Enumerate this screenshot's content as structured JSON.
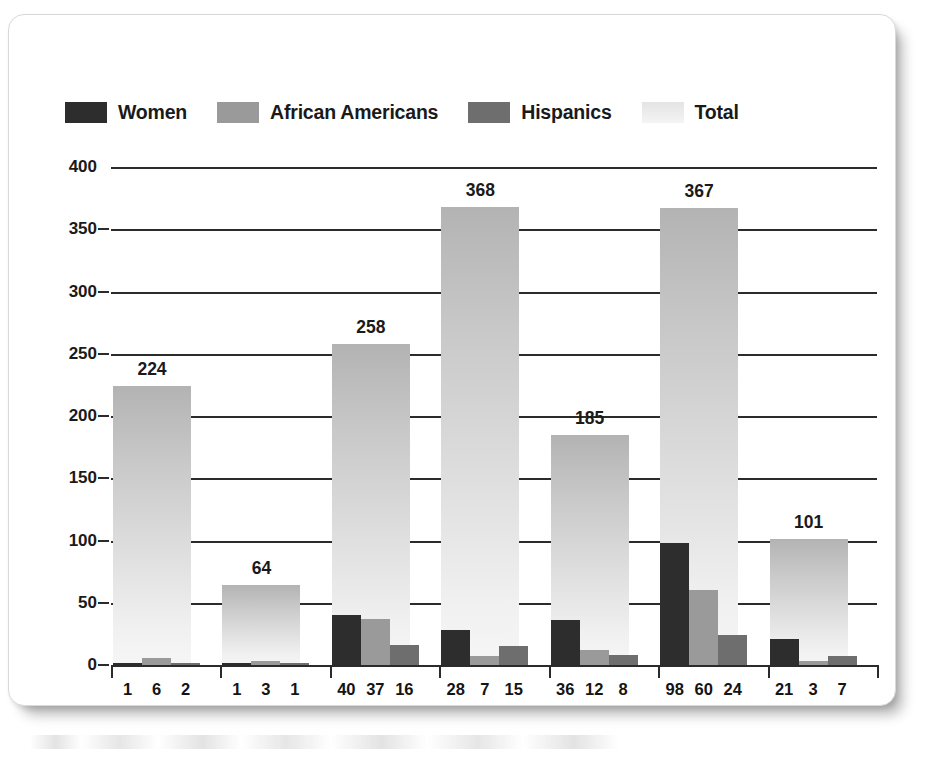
{
  "legend": {
    "items": [
      {
        "label": "Women",
        "key": "women",
        "color": "#2d2d2d"
      },
      {
        "label": "African Americans",
        "key": "african",
        "color": "#9a9a9a"
      },
      {
        "label": "Hispanics",
        "key": "hisp",
        "color": "#6e6e6e"
      },
      {
        "label": "Total",
        "key": "total",
        "color": "#ececec"
      }
    ]
  },
  "axis": {
    "y_ticks": [
      "400",
      "350",
      "300",
      "250",
      "200",
      "150",
      "100",
      "50",
      "0"
    ]
  },
  "chart_data": {
    "type": "bar",
    "title": "",
    "subtitle": "",
    "xlabel": "",
    "ylabel": "",
    "ylim": [
      0,
      400
    ],
    "ytick_values": [
      0,
      50,
      100,
      150,
      200,
      250,
      300,
      350,
      400
    ],
    "grid": true,
    "legend_position": "top-left",
    "categories": [
      "Nixon",
      "Ford",
      "Carter",
      "Reagan",
      "Bush",
      "Clinton",
      "George W. Bush"
    ],
    "series": [
      {
        "name": "Women",
        "values": [
          1,
          1,
          40,
          28,
          36,
          98,
          21
        ]
      },
      {
        "name": "African Americans",
        "values": [
          6,
          3,
          37,
          7,
          12,
          60,
          3
        ]
      },
      {
        "name": "Hispanics",
        "values": [
          2,
          1,
          16,
          15,
          8,
          24,
          7
        ]
      },
      {
        "name": "Total",
        "values": [
          224,
          64,
          258,
          368,
          185,
          367,
          101
        ]
      }
    ],
    "total_labels": [
      "224",
      "64",
      "258",
      "368",
      "367",
      "185",
      "101"
    ],
    "annotations": [
      {
        "category": "Nixon",
        "text": "224"
      },
      {
        "category": "Ford",
        "text": "64"
      },
      {
        "category": "Carter",
        "text": "258"
      },
      {
        "category": "Reagan",
        "text": "368"
      },
      {
        "category": "Bush",
        "text": "185"
      },
      {
        "category": "Clinton",
        "text": "367"
      },
      {
        "category": "George W. Bush",
        "text": "101"
      }
    ],
    "value_labels": [
      [
        "1",
        "6",
        "2"
      ],
      [
        "1",
        "3",
        "1"
      ],
      [
        "40",
        "37",
        "16"
      ],
      [
        "28",
        "7",
        "15"
      ],
      [
        "36",
        "12",
        "8"
      ],
      [
        "98",
        "60",
        "24"
      ],
      [
        "21",
        "3",
        "7"
      ]
    ]
  }
}
